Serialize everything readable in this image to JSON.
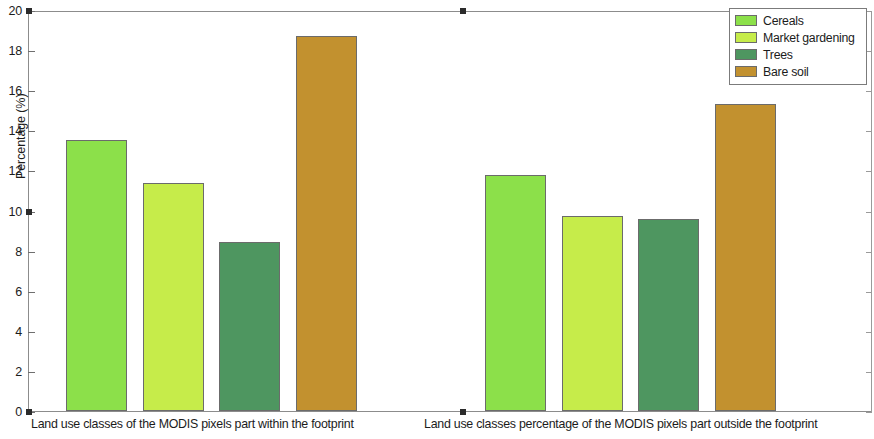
{
  "chart_data": {
    "type": "bar",
    "title": "",
    "subtitle": "",
    "xlabel": "",
    "ylabel": "Percentage (%)",
    "ylim": [
      0,
      20
    ],
    "ytick_labels": [
      "0",
      "2",
      "4",
      "6",
      "8",
      "10",
      "12",
      "14",
      "16",
      "18",
      "20"
    ],
    "ytick_values": [
      0,
      2,
      4,
      6,
      8,
      10,
      12,
      14,
      16,
      18,
      20
    ],
    "grid": false,
    "legend_position": "top-right",
    "legend": [
      "Cereals",
      "Market gardening",
      "Trees",
      "Bare soil"
    ],
    "categories": [
      "Land use classes of the MODIS pixels part within the footprint",
      "Land use classes percentage of the MODIS pixels part outside the footprint"
    ],
    "series": [
      {
        "name": "Cereals",
        "color": "#8ce04a",
        "values": [
          13.5,
          11.75
        ]
      },
      {
        "name": "Market gardening",
        "color": "#c6ec4a",
        "values": [
          11.35,
          9.75
        ]
      },
      {
        "name": "Trees",
        "color": "#4e9660",
        "values": [
          8.45,
          9.6
        ]
      },
      {
        "name": "Bare soil",
        "color": "#c2912f",
        "values": [
          18.7,
          15.3
        ]
      }
    ]
  },
  "axis": {
    "ylabel": "Percentage (%)",
    "ymin_label": "0",
    "ymax_label": "20"
  },
  "xaxis": {
    "group1_label": "Land use classes of the MODIS pixels part within the footprint",
    "group2_label": "Land use classes percentage of the MODIS pixels part outside the footprint"
  },
  "legend": {
    "items": [
      {
        "label": "Cereals",
        "color": "#8ce04a"
      },
      {
        "label": "Market gardening",
        "color": "#c6ec4a"
      },
      {
        "label": "Trees",
        "color": "#4e9660"
      },
      {
        "label": "Bare soil",
        "color": "#c2912f"
      }
    ]
  },
  "yticks": [
    {
      "label": "20",
      "value": 20
    },
    {
      "label": "18",
      "value": 18
    },
    {
      "label": "16",
      "value": 16
    },
    {
      "label": "14",
      "value": 14
    },
    {
      "label": "12",
      "value": 12
    },
    {
      "label": "10",
      "value": 10
    },
    {
      "label": "8",
      "value": 8
    },
    {
      "label": "6",
      "value": 6
    },
    {
      "label": "4",
      "value": 4
    },
    {
      "label": "2",
      "value": 2
    },
    {
      "label": "0",
      "value": 0
    }
  ]
}
